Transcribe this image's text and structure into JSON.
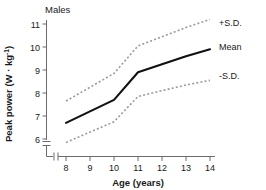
{
  "panel": {
    "title": "Males"
  },
  "axes": {
    "x": {
      "label": "Age (years)",
      "unit": "years",
      "ticks": [
        "8",
        "9",
        "10",
        "11",
        "12",
        "13",
        "14"
      ],
      "range": [
        8,
        14
      ],
      "has_break": true
    },
    "y": {
      "label_main": "Peak power (W · kg",
      "label_sup": "-1",
      "label_close": ")",
      "label_plain": "Peak power (W · kg-1)",
      "ticks": [
        "6",
        "7",
        "8",
        "9",
        "10",
        "11"
      ],
      "range": [
        6,
        11
      ],
      "has_break": true
    }
  },
  "legend": {
    "position": "right",
    "items": [
      {
        "label": "+S.D.",
        "style": "dotted"
      },
      {
        "label": "Mean",
        "style": "solid"
      },
      {
        "label": "-S.D.",
        "style": "dotted"
      }
    ]
  },
  "colors": {
    "mean_line": "#111111",
    "sd_line": "#9a9a9a",
    "axis": "#6b6b6b",
    "text": "#1a1a1a",
    "background": "#ffffff"
  },
  "chart_data": {
    "type": "line",
    "title": "Males",
    "xlabel": "Age (years)",
    "ylabel": "Peak power (W · kg-1)",
    "xlim": [
      8,
      14
    ],
    "ylim": [
      5.6,
      11.4
    ],
    "grid": false,
    "legend_position": "right",
    "x": [
      8,
      9,
      10,
      11,
      12,
      13,
      14
    ],
    "series": [
      {
        "name": "+S.D.",
        "style": "dotted",
        "values": [
          7.65,
          8.25,
          8.85,
          10.05,
          10.45,
          10.85,
          11.2
        ]
      },
      {
        "name": "Mean",
        "style": "solid",
        "values": [
          6.7,
          7.2,
          7.7,
          8.9,
          9.25,
          9.6,
          9.9
        ]
      },
      {
        "name": "-S.D.",
        "style": "dotted",
        "values": [
          5.85,
          6.3,
          6.75,
          7.85,
          8.1,
          8.35,
          8.55
        ]
      }
    ]
  }
}
